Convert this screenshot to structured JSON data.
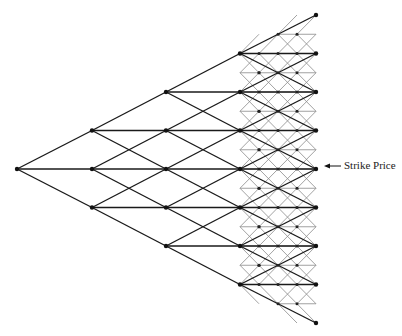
{
  "diagram": {
    "type": "trinomial-tree-with-fine-lattice",
    "annotation": {
      "label": "Strike Price",
      "arrow_target_y": 166
    },
    "coarse_tree": {
      "steps": 4,
      "x_positions": [
        17,
        92,
        166,
        240,
        316
      ],
      "center_y": 169,
      "y_step": 38.5,
      "color": "#1a1a1a"
    },
    "fine_lattice": {
      "x_start": 240,
      "x_end": 316,
      "x_step": 19,
      "y_step": 19.25,
      "color": "#8a8a8a"
    }
  }
}
